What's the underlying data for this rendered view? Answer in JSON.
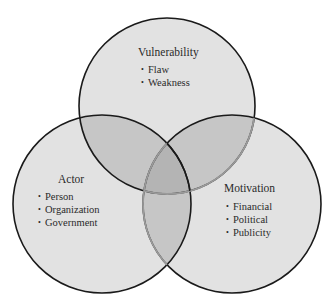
{
  "diagram": {
    "type": "venn-3",
    "colors": {
      "circle_fill": "#e2e2e2",
      "overlap_fill": "#c4c4c4",
      "center_fill": "#b6b6b6",
      "stroke": "#1a1a1a",
      "text": "#2a2a2a"
    },
    "sets": [
      {
        "id": "vulnerability",
        "title": "Vulnerability",
        "items": [
          "Flaw",
          "Weakness"
        ]
      },
      {
        "id": "actor",
        "title": "Actor",
        "items": [
          "Person",
          "Organization",
          "Government"
        ]
      },
      {
        "id": "motivation",
        "title": "Motivation",
        "items": [
          "Financial",
          "Political",
          "Publicity"
        ]
      }
    ]
  }
}
